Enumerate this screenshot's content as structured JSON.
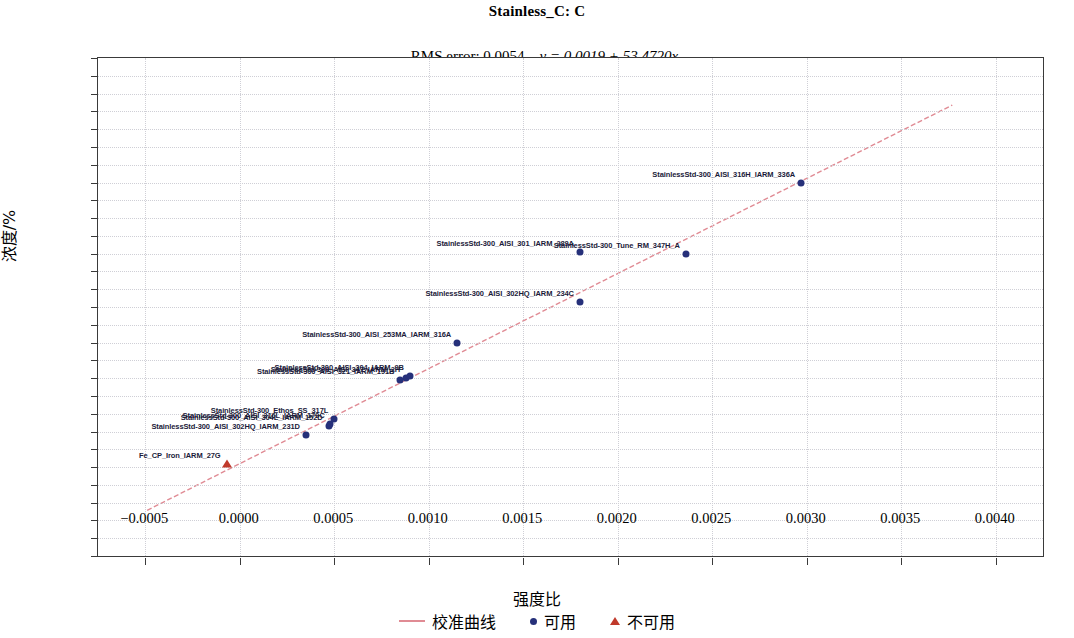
{
  "chart_data": {
    "type": "scatter",
    "title": "Stainless_C: C",
    "subtitle_rms": "RMS error: 0.0054",
    "subtitle_eq": "y = 0.0019 + 53.4720x",
    "rms_error": 0.0054,
    "fit": {
      "intercept": 0.0019,
      "slope": 53.472
    },
    "xlabel": "强度比",
    "ylabel": "浓度/%",
    "xlim": [
      -0.00075,
      0.00425
    ],
    "ylim": [
      -0.05,
      0.23
    ],
    "xticks": [
      -0.0005,
      0.0,
      0.0005,
      0.001,
      0.0015,
      0.002,
      0.0025,
      0.003,
      0.0035,
      0.004
    ],
    "xtick_labels": [
      "−0.0005",
      "0.0000",
      "0.0005",
      "0.0010",
      "0.0015",
      "0.0020",
      "0.0025",
      "0.0030",
      "0.0035",
      "0.0040"
    ],
    "yticks": [
      0.23,
      0.22,
      0.21,
      0.2,
      0.19,
      0.18,
      0.17,
      0.16,
      0.15,
      0.14,
      0.13,
      0.12,
      0.11,
      0.1,
      0.09,
      0.08,
      0.07,
      0.06,
      0.05,
      0.04,
      0.03,
      0.02,
      0.01,
      0.0,
      -0.01,
      -0.02,
      -0.03,
      -0.04,
      -0.05
    ],
    "ytick_labels": [
      "0.23",
      "0.22",
      "0.21",
      "0.20",
      "0.19",
      "0.18",
      "0.17",
      "0.16",
      "0.15",
      "0.14",
      "0.13",
      "0.12",
      "0.11",
      "0.10",
      "0.09",
      "0.08",
      "0.07",
      "0.06",
      "0.05",
      "0.04",
      "0.03",
      "0.02",
      "0.01",
      "0.00",
      "−0.01",
      "−0.02",
      "−0.03",
      "−0.04",
      "−0.05"
    ],
    "grid": true,
    "legend_position": "bottom",
    "line_color": "#e08b94",
    "ok_color": "#26307a",
    "bad_color": "#c0392b",
    "legend": [
      {
        "label": "校准曲线",
        "marker": "line"
      },
      {
        "label": "可用",
        "marker": "circle"
      },
      {
        "label": "不可用",
        "marker": "triangle"
      }
    ],
    "points": [
      {
        "label": "Fe_CP_Iron_IARM_27G",
        "x": -7e-05,
        "y": 0.002,
        "status": "bad",
        "label_side": "left"
      },
      {
        "label": "StainlessStd-300_AISI_302HQ_IARM_231D",
        "x": 0.00035,
        "y": 0.018,
        "status": "ok",
        "label_side": "left"
      },
      {
        "label": "StainlessStd-300_AISI_304L_IARM_152D",
        "x": 0.00047,
        "y": 0.023,
        "status": "ok",
        "label_side": "left"
      },
      {
        "label": "StainlessStd-300_AISI_316L_IARM_179C",
        "x": 0.00048,
        "y": 0.024,
        "status": "ok",
        "label_side": "left"
      },
      {
        "label": "StainlessStd-300_Ethos_SS_317L",
        "x": 0.0005,
        "y": 0.027,
        "status": "ok",
        "label_side": "left"
      },
      {
        "label": "StainlessStd-300_AISI_321_IARM_191B",
        "x": 0.00085,
        "y": 0.049,
        "status": "ok",
        "label_side": "left"
      },
      {
        "label": "StainlessStd-300_AISI_347_IARM_2H",
        "x": 0.00088,
        "y": 0.05,
        "status": "ok",
        "label_side": "left"
      },
      {
        "label": "StainlessStd-300_AISI_304_IARM_9B",
        "x": 0.0009,
        "y": 0.051,
        "status": "ok",
        "label_side": "left"
      },
      {
        "label": "StainlessStd-300_AISI_253MA_IARM_316A",
        "x": 0.00115,
        "y": 0.07,
        "status": "ok",
        "label_side": "left"
      },
      {
        "label": "StainlessStd-300_AISI_302HQ_IARM_234C",
        "x": 0.0018,
        "y": 0.093,
        "status": "ok",
        "label_side": "left"
      },
      {
        "label": "StainlessStd-300_AISI_301_IARM_289A",
        "x": 0.0018,
        "y": 0.121,
        "status": "ok",
        "label_side": "left"
      },
      {
        "label": "StainlessStd-300_Tune_RM_347H_A",
        "x": 0.00236,
        "y": 0.12,
        "status": "ok",
        "label_side": "left"
      },
      {
        "label": "StainlessStd-300_AISI_316H_IARM_336A",
        "x": 0.00297,
        "y": 0.16,
        "status": "ok",
        "label_side": "left"
      }
    ],
    "line_endpoints": {
      "x1": -0.00049,
      "y1": -0.0243,
      "x2": 0.00377,
      "y2": 0.2035
    }
  }
}
